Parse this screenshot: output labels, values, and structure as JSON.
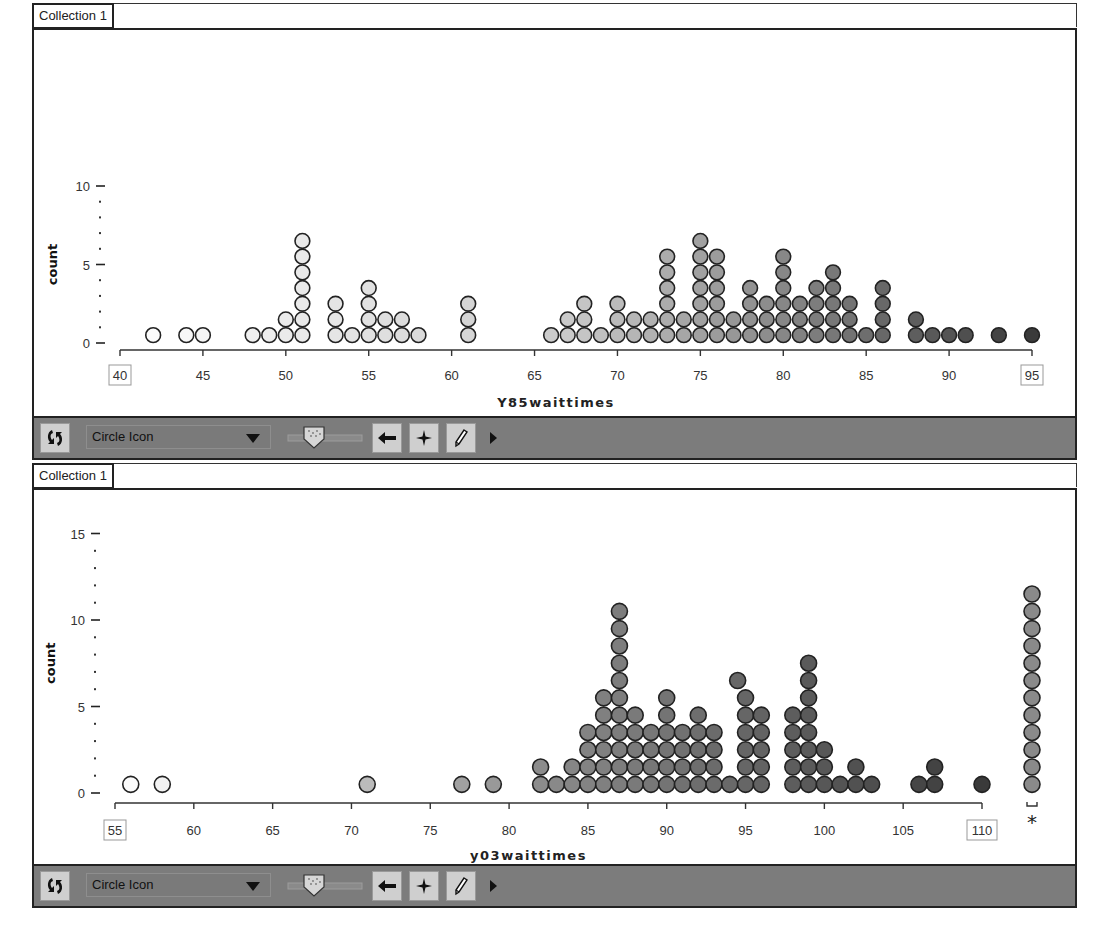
{
  "panels": [
    {
      "tab_label": "Collection 1",
      "toolbar": {
        "rescale_button": "rescale-icon",
        "icon_select_value": "Circle Icon",
        "slider_label": "point-size-slider",
        "back_button": "arrow-left-icon",
        "add_button": "crosshair-icon",
        "draw_button": "pencil-icon",
        "expand_button": "play-right-icon"
      }
    },
    {
      "tab_label": "Collection 1",
      "toolbar": {
        "rescale_button": "rescale-icon",
        "icon_select_value": "Circle Icon",
        "slider_label": "point-size-slider",
        "back_button": "arrow-left-icon",
        "add_button": "crosshair-icon",
        "draw_button": "pencil-icon",
        "expand_button": "play-right-icon"
      }
    }
  ],
  "chart_data": [
    {
      "type": "scatter",
      "subtype": "dot_plot",
      "title": "",
      "xlabel": "Y85waittimes",
      "ylabel": "count",
      "xlim": [
        40,
        95
      ],
      "ylim": [
        0,
        10
      ],
      "x_ticks": [
        "40",
        "45",
        "50",
        "55",
        "60",
        "65",
        "70",
        "75",
        "80",
        "85",
        "90",
        "95"
      ],
      "y_ticks": [
        "0",
        "5",
        "10"
      ],
      "boxed_tick_labels": [
        "40",
        "95"
      ],
      "grid": false,
      "points": [
        {
          "x": 42,
          "count": 1
        },
        {
          "x": 44,
          "count": 1
        },
        {
          "x": 45,
          "count": 1
        },
        {
          "x": 48,
          "count": 1
        },
        {
          "x": 49,
          "count": 1
        },
        {
          "x": 50,
          "count": 2
        },
        {
          "x": 51,
          "count": 7
        },
        {
          "x": 53,
          "count": 3
        },
        {
          "x": 54,
          "count": 1
        },
        {
          "x": 55,
          "count": 4
        },
        {
          "x": 56,
          "count": 2
        },
        {
          "x": 57,
          "count": 2
        },
        {
          "x": 58,
          "count": 1
        },
        {
          "x": 61,
          "count": 3
        },
        {
          "x": 66,
          "count": 1
        },
        {
          "x": 67,
          "count": 2
        },
        {
          "x": 68,
          "count": 3
        },
        {
          "x": 69,
          "count": 1
        },
        {
          "x": 70,
          "count": 3
        },
        {
          "x": 71,
          "count": 2
        },
        {
          "x": 72,
          "count": 2
        },
        {
          "x": 73,
          "count": 6
        },
        {
          "x": 74,
          "count": 2
        },
        {
          "x": 75,
          "count": 7
        },
        {
          "x": 76,
          "count": 6
        },
        {
          "x": 77,
          "count": 2
        },
        {
          "x": 78,
          "count": 4
        },
        {
          "x": 79,
          "count": 3
        },
        {
          "x": 80,
          "count": 6
        },
        {
          "x": 81,
          "count": 3
        },
        {
          "x": 82,
          "count": 4
        },
        {
          "x": 83,
          "count": 5
        },
        {
          "x": 84,
          "count": 3
        },
        {
          "x": 85,
          "count": 1
        },
        {
          "x": 86,
          "count": 4
        },
        {
          "x": 88,
          "count": 2
        },
        {
          "x": 89,
          "count": 1
        },
        {
          "x": 90,
          "count": 1
        },
        {
          "x": 91,
          "count": 1
        },
        {
          "x": 93,
          "count": 1
        },
        {
          "x": 95,
          "count": 1
        }
      ],
      "color_scale": {
        "low": "#ffffff",
        "mid": "#c8c8c8",
        "high": "#3a3a3a"
      }
    },
    {
      "type": "scatter",
      "subtype": "dot_plot",
      "title": "",
      "xlabel": "y03waittimes",
      "ylabel": "count",
      "xlim": [
        55,
        110
      ],
      "ylim": [
        0,
        15
      ],
      "x_ticks": [
        "55",
        "60",
        "65",
        "70",
        "75",
        "80",
        "85",
        "90",
        "95",
        "100",
        "105",
        "110"
      ],
      "y_ticks": [
        "0",
        "5",
        "10",
        "15"
      ],
      "boxed_tick_labels": [
        "55",
        "110"
      ],
      "grid": false,
      "points": [
        {
          "x": 56,
          "count": 1
        },
        {
          "x": 58,
          "count": 1
        },
        {
          "x": 71,
          "count": 1
        },
        {
          "x": 77,
          "count": 1
        },
        {
          "x": 79,
          "count": 1
        },
        {
          "x": 82,
          "count": 2
        },
        {
          "x": 83,
          "count": 1
        },
        {
          "x": 84,
          "count": 2
        },
        {
          "x": 85,
          "count": 4
        },
        {
          "x": 86,
          "count": 6
        },
        {
          "x": 87,
          "count": 11
        },
        {
          "x": 88,
          "count": 5
        },
        {
          "x": 89,
          "count": 4
        },
        {
          "x": 90,
          "count": 6
        },
        {
          "x": 91,
          "count": 4
        },
        {
          "x": 92,
          "count": 5
        },
        {
          "x": 93,
          "count": 4
        },
        {
          "x": 94,
          "count": 1
        },
        {
          "x": 94.5,
          "count": 1,
          "stack_from": 6
        },
        {
          "x": 95,
          "count": 6
        },
        {
          "x": 96,
          "count": 5
        },
        {
          "x": 98,
          "count": 5
        },
        {
          "x": 99,
          "count": 8
        },
        {
          "x": 100,
          "count": 3
        },
        {
          "x": 101,
          "count": 1
        },
        {
          "x": 102,
          "count": 2
        },
        {
          "x": 103,
          "count": 1
        },
        {
          "x": 106,
          "count": 1
        },
        {
          "x": 107,
          "count": 2
        },
        {
          "x": 110,
          "count": 1
        }
      ],
      "missing_values": {
        "count": 12,
        "marker": "*"
      },
      "color_scale": {
        "low": "#ffffff",
        "mid": "#8a8a8a",
        "high": "#3a3a3a"
      }
    }
  ]
}
